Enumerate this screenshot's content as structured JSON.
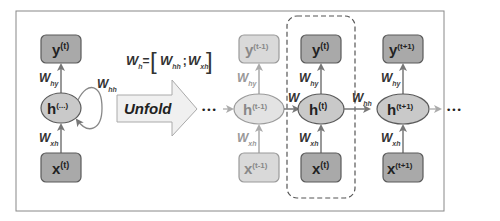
{
  "diagram": {
    "title_equation": {
      "lhs": "W",
      "lhs_sub": "h",
      "eq": "=",
      "bracket_open": "[",
      "bracket_close": "]",
      "term1": "W",
      "term1_sub": "hh",
      "sep": ";",
      "term2": "W",
      "term2_sub": "xh"
    },
    "unfold_label": "Unfold",
    "ellipsis": "•••",
    "colors": {
      "box_dark": "#a9a9a9",
      "box_light": "#d9d9d9",
      "border_dark": "#5a5a5a",
      "border_light": "#9a9a9a",
      "arrow_dark": "#777777",
      "arrow_light": "#aaaaaa",
      "frame": "#888888",
      "unfold_fill": "#f0f0f0"
    },
    "folded": {
      "output": {
        "base": "y",
        "sup": "(t)"
      },
      "hidden": {
        "base": "h",
        "sup": "(...)"
      },
      "input": {
        "base": "x",
        "sup": "(t)"
      },
      "w_hy": {
        "base": "W",
        "sub": "hy"
      },
      "w_xh": {
        "base": "W",
        "sub": "xh"
      },
      "w_hh": {
        "base": "W",
        "sub": "hh"
      }
    },
    "steps": [
      {
        "output": {
          "base": "y",
          "sup": "(t-1)"
        },
        "hidden": {
          "base": "h",
          "sup": "(t-1)"
        },
        "input": {
          "base": "x",
          "sup": "(t-1)"
        },
        "w_hy": {
          "base": "W",
          "sub": "hy"
        },
        "w_xh": {
          "base": "W",
          "sub": "xh"
        },
        "faded": true
      },
      {
        "output": {
          "base": "y",
          "sup": "(t)"
        },
        "hidden": {
          "base": "h",
          "sup": "(t)"
        },
        "input": {
          "base": "x",
          "sup": "(t)"
        },
        "w_hy": {
          "base": "W",
          "sub": "hy"
        },
        "w_xh": {
          "base": "W",
          "sub": "xh"
        },
        "faded": false
      },
      {
        "output": {
          "base": "y",
          "sup": "(t+1)"
        },
        "hidden": {
          "base": "h",
          "sup": "(t+1)"
        },
        "input": {
          "base": "x",
          "sup": "(t+1)"
        },
        "w_hy": {
          "base": "W",
          "sub": "hy"
        },
        "w_xh": {
          "base": "W",
          "sub": "xh"
        },
        "faded": false
      }
    ],
    "transitions": [
      {
        "base": "W",
        "sub": "hh"
      },
      {
        "base": "W",
        "sub": "hh"
      }
    ]
  }
}
